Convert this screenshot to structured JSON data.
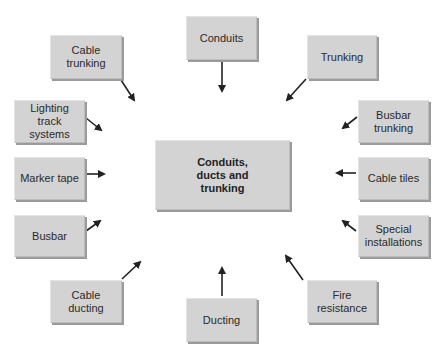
{
  "diagram": {
    "center": {
      "label_lines": [
        "Conduits,",
        "ducts and",
        "trunking"
      ]
    },
    "nodes": [
      {
        "id": "conduits",
        "label_lines": [
          "Conduits"
        ],
        "box": [
          186,
          16,
          71,
          44
        ],
        "arrow": [
          222,
          62,
          222,
          91
        ]
      },
      {
        "id": "cable-trunking",
        "label_lines": [
          "Cable",
          "trunking"
        ],
        "box": [
          50,
          35,
          72,
          44
        ],
        "arrow": [
          121,
          80,
          134,
          100
        ]
      },
      {
        "id": "trunking",
        "label_lines": [
          "Trunking"
        ],
        "box": [
          307,
          35,
          70,
          44
        ],
        "arrow": [
          306,
          79,
          287,
          100
        ]
      },
      {
        "id": "lighting-track-systems",
        "label_lines": [
          "Lighting",
          "track",
          "systems"
        ],
        "box": [
          14,
          100,
          71,
          43
        ],
        "arrow": [
          86,
          118,
          101,
          130
        ]
      },
      {
        "id": "busbar-trunking",
        "label_lines": [
          "Busbar",
          "trunking"
        ],
        "box": [
          358,
          100,
          71,
          43
        ],
        "arrow": [
          357,
          117,
          343,
          128
        ]
      },
      {
        "id": "marker-tape",
        "label_lines": [
          "Marker tape"
        ],
        "box": [
          14,
          157,
          71,
          43
        ],
        "arrow": [
          86,
          174,
          104,
          174
        ]
      },
      {
        "id": "cable-tiles",
        "label_lines": [
          "Cable tiles"
        ],
        "box": [
          358,
          157,
          71,
          43
        ],
        "arrow": [
          356,
          173,
          337,
          173
        ]
      },
      {
        "id": "busbar",
        "label_lines": [
          "Busbar"
        ],
        "box": [
          14,
          215,
          71,
          42
        ],
        "arrow": [
          86,
          231,
          100,
          221
        ]
      },
      {
        "id": "special-installations",
        "label_lines": [
          "Special",
          "installations"
        ],
        "box": [
          358,
          215,
          71,
          42
        ],
        "arrow": [
          356,
          231,
          343,
          221
        ]
      },
      {
        "id": "cable-ducting",
        "label_lines": [
          "Cable",
          "ducting"
        ],
        "box": [
          50,
          280,
          72,
          43
        ],
        "arrow": [
          122,
          279,
          140,
          262
        ]
      },
      {
        "id": "fire-resistance",
        "label_lines": [
          "Fire",
          "resistance"
        ],
        "box": [
          307,
          280,
          70,
          43
        ],
        "arrow": [
          303,
          280,
          286,
          256
        ]
      },
      {
        "id": "ducting",
        "label_lines": [
          "Ducting"
        ],
        "box": [
          186,
          298,
          71,
          44
        ],
        "arrow": [
          222,
          296,
          222,
          268
        ]
      }
    ],
    "center_box": [
      155,
      140,
      135,
      70
    ],
    "colors": {
      "box_fill": "#d3d3d3",
      "box_shadow": "#9a9a9a",
      "arrow": "#222222",
      "text": "#2a2a2a"
    }
  }
}
